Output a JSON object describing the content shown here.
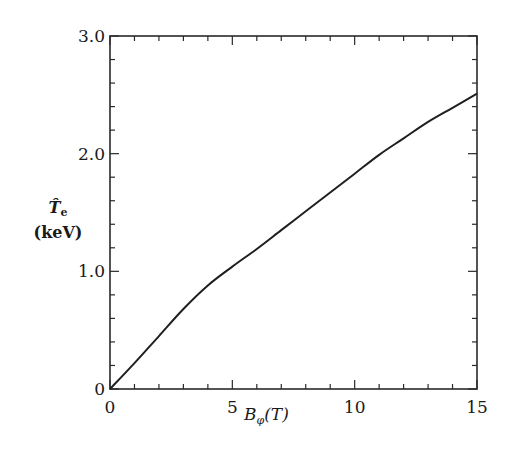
{
  "chart_data": {
    "type": "line",
    "title": "",
    "xlabel": "B_φ(T)",
    "ylabel": "T̂_e (keV)",
    "xlim": [
      0,
      15
    ],
    "ylim": [
      0,
      3.0
    ],
    "x_ticks": [
      0,
      5,
      10,
      15
    ],
    "x_tick_labels": [
      "0",
      "5",
      "10",
      "15"
    ],
    "x_minor_step": 1,
    "y_ticks": [
      0,
      1.0,
      2.0,
      3.0
    ],
    "y_tick_labels": [
      "0",
      "1.0",
      "2.0",
      "3.0"
    ],
    "y_minor_step": 0.2,
    "grid": false,
    "legend": null,
    "series": [
      {
        "name": "T_e",
        "x": [
          0,
          1,
          2,
          3,
          4,
          5,
          6,
          7,
          8,
          9,
          10,
          11,
          12,
          13,
          14,
          15
        ],
        "values": [
          0,
          0.22,
          0.45,
          0.68,
          0.88,
          1.04,
          1.19,
          1.35,
          1.51,
          1.67,
          1.83,
          1.99,
          2.13,
          2.27,
          2.39,
          2.51
        ]
      }
    ]
  },
  "labels": {
    "y_symbol": "T̂",
    "y_sub": "e",
    "y_unit": "(keV)",
    "x_symbol": "B",
    "x_sub": "φ",
    "x_unit": "(T)"
  },
  "colors": {
    "line": "#1f1f1f",
    "axes": "#2a2a2a",
    "background": "#ffffff"
  }
}
